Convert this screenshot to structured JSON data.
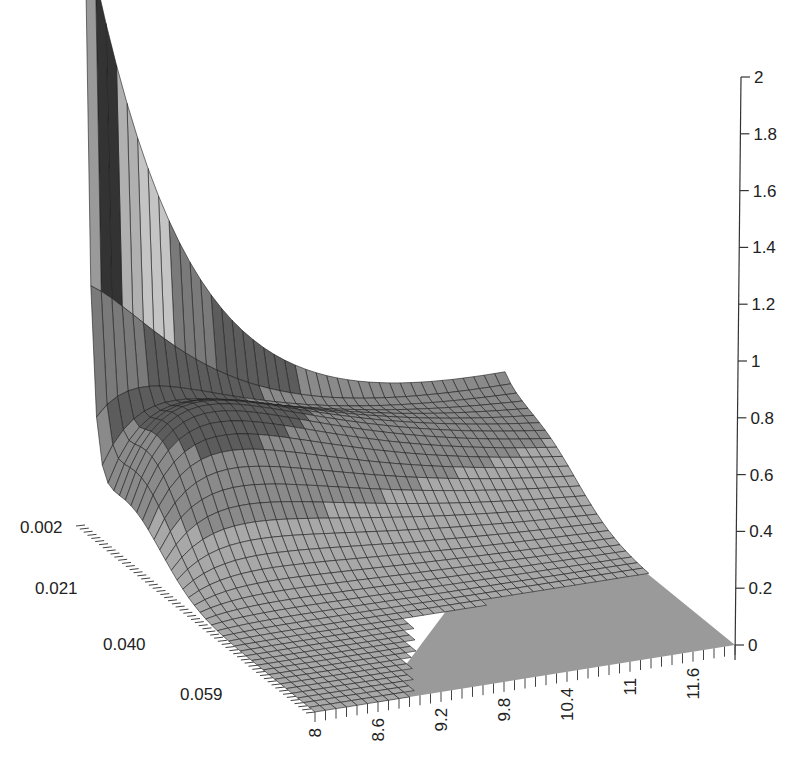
{
  "chart_data": {
    "type": "surface3d",
    "title": "",
    "xlabel": "",
    "ylabel": "",
    "zlabel": "",
    "x_axis": {
      "ticks": [
        "8",
        "8.6",
        "9.2",
        "9.8",
        "10.4",
        "11",
        "11.6"
      ],
      "range": [
        8,
        12
      ]
    },
    "y_axis": {
      "ticks": [
        "0.002",
        "0.021",
        "0.040",
        "0.059"
      ],
      "range": [
        0.002,
        0.059
      ]
    },
    "z_axis": {
      "ticks": [
        "0",
        "0.2",
        "0.4",
        "0.6",
        "0.8",
        "1",
        "1.2",
        "1.4",
        "1.6",
        "1.8",
        "2"
      ],
      "range": [
        0,
        2
      ]
    },
    "grid": false,
    "legend": null,
    "colors": {
      "light": "#c8c8c8",
      "mid": "#8c8c8c",
      "dark": "#3a3a3a",
      "base": "#9a9a9a",
      "line": "#1e1e1e"
    }
  }
}
